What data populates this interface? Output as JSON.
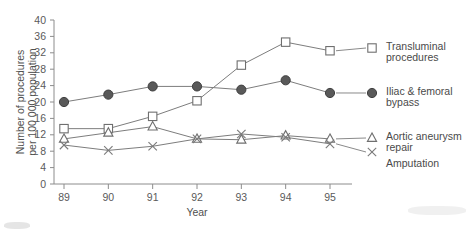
{
  "chart_data": {
    "type": "line",
    "title": "",
    "xlabel": "Year",
    "ylabel": "Number of procedures per 100 000 population",
    "ylabel_line1": "Number of procedures",
    "ylabel_line2": "per 100 000 population",
    "categories": [
      "89",
      "90",
      "91",
      "92",
      "93",
      "94",
      "95"
    ],
    "x": [
      1989,
      1990,
      1991,
      1992,
      1993,
      1994,
      1995
    ],
    "xlim": [
      1988.6,
      1995.4
    ],
    "ylim": [
      0,
      40
    ],
    "yticks": [
      0,
      4,
      8,
      12,
      16,
      20,
      24,
      28,
      32,
      36,
      40
    ],
    "xticks": [
      "89",
      "90",
      "91",
      "92",
      "93",
      "94",
      "95"
    ],
    "grid": false,
    "legend_position": "right-outside",
    "series": [
      {
        "name": "Transluminal procedures",
        "label_line1": "Transluminal",
        "label_line2": "procedures",
        "marker": "open-square",
        "values": [
          13.5,
          13.5,
          16.5,
          20.3,
          29.0,
          34.6,
          32.5
        ]
      },
      {
        "name": "Iliac & femoral bypass",
        "label_line1": "Iliac & femoral",
        "label_line2": "bypass",
        "marker": "filled-circle",
        "values": [
          20.0,
          21.8,
          23.8,
          23.8,
          23.0,
          25.3,
          22.2
        ]
      },
      {
        "name": "Aortic aneurysm repair",
        "label_line1": "Aortic aneurysm",
        "label_line2": "repair",
        "marker": "open-triangle",
        "values": [
          11.0,
          12.5,
          14.0,
          11.0,
          10.8,
          11.8,
          11.0
        ]
      },
      {
        "name": "Amputation",
        "label_line1": "Amputation",
        "label_line2": "",
        "marker": "cross",
        "values": [
          9.5,
          8.2,
          9.2,
          11.0,
          12.2,
          11.4,
          9.8
        ]
      }
    ]
  },
  "colors": {
    "axis": "#8c8c8c",
    "line": "#7d7d7d",
    "marker_fill_dark": "#595959",
    "marker_fill_light": "#ffffff",
    "text": "#4a4a4a",
    "background": "#ffffff"
  }
}
